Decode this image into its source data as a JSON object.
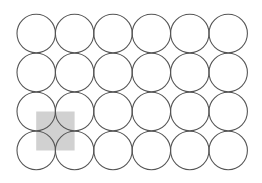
{
  "diagram": {
    "type": "circle-grid",
    "rows": 4,
    "cols": 6,
    "origin": {
      "cx": 36.2,
      "cy": 33.5
    },
    "spacing": {
      "dx": 38.4,
      "dy": 39.0
    },
    "radius": 19.2,
    "stroke_color": "#555555",
    "stroke_width": 1.1,
    "fill_color": "#ffffff",
    "highlight": {
      "description": "shaded square spanning centers of rows 3-4, columns 1-2",
      "row_start": 2,
      "col_start": 0,
      "rows_spanned": 1,
      "cols_spanned": 1,
      "fill_color": "#cccccc",
      "opacity": 0.9
    }
  }
}
